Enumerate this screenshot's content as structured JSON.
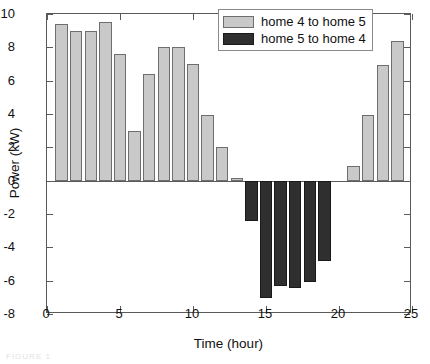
{
  "chart_data": {
    "type": "bar",
    "title": "",
    "xlabel": "Time (hour)",
    "ylabel": "Power (kW)",
    "xlim": [
      0,
      25
    ],
    "ylim": [
      -8,
      10
    ],
    "xticks": [
      0,
      5,
      10,
      15,
      20,
      25
    ],
    "yticks": [
      -8,
      -6,
      -4,
      -2,
      0,
      2,
      4,
      6,
      8,
      10
    ],
    "grid": false,
    "legend_position": "top-right",
    "bar_width": 0.85,
    "x": [
      1,
      2,
      3,
      4,
      5,
      6,
      7,
      8,
      9,
      10,
      11,
      12,
      13,
      14,
      15,
      16,
      17,
      18,
      19,
      20,
      21,
      22,
      23,
      24
    ],
    "series": [
      {
        "name": "home 4 to home 5",
        "color": "#c9c9c9",
        "values": [
          9.4,
          9.0,
          9.0,
          9.5,
          7.6,
          3.0,
          6.4,
          8.0,
          8.0,
          7.0,
          3.95,
          2.0,
          0.15,
          0,
          0,
          0,
          0,
          0,
          0,
          0,
          0.9,
          3.95,
          6.95,
          8.4
        ]
      },
      {
        "name": "home 5 to home 4",
        "color": "#2f2f2f",
        "values": [
          0,
          0,
          0,
          0,
          0,
          0,
          0,
          0,
          0,
          0,
          0,
          0,
          0,
          -2.45,
          -7.05,
          -6.3,
          -6.45,
          -6.1,
          -4.85,
          0,
          0,
          0,
          0,
          0
        ]
      }
    ]
  },
  "legend": {
    "items": [
      {
        "label": "home 4 to home 5",
        "swatch": "pos"
      },
      {
        "label": "home 5 to home 4",
        "swatch": "neg"
      }
    ]
  },
  "axes": {
    "y_title": "Power (kW)",
    "x_title": "Time (hour)",
    "y_tick_labels": [
      "10",
      "8",
      "6",
      "4",
      "2",
      "0",
      "-2",
      "-4",
      "-6",
      "-8"
    ],
    "x_tick_labels": [
      "0",
      "5",
      "10",
      "15",
      "20",
      "25"
    ]
  },
  "caption": {
    "artifact": "FIGURE 1"
  }
}
